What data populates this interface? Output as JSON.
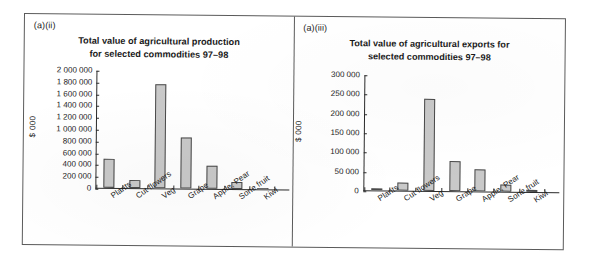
{
  "figure": {
    "panels": [
      {
        "label": "(a)(ii)",
        "title_line1": "Total value of agricultural production",
        "title_line2": "for selected commodities 97–98"
      },
      {
        "label": "(a)(iii)",
        "title_line1": "Total value of agricultural exports for",
        "title_line2": "selected commodities 97–98"
      }
    ]
  },
  "chart_data": [
    {
      "type": "bar",
      "title": "Total value of agricultural production for selected commodities 97–98",
      "panel_label": "(a)(ii)",
      "xlabel": "",
      "ylabel": "$ 000",
      "ylim": [
        0,
        2000000
      ],
      "ytick_step": 200000,
      "grid": false,
      "legend": "none",
      "bar_color": "#c9c9c9",
      "bar_edge_color": "#4a4a4a",
      "categories": [
        "Plants",
        "Cut flowers",
        "Veg",
        "Grape",
        "Apple, Pear",
        "Sone fruit",
        "Kiwi"
      ],
      "values": [
        500000,
        130000,
        1780000,
        880000,
        400000,
        120000,
        0
      ],
      "ytick_labels": [
        "0",
        "200 000",
        "400 000",
        "600 000",
        "800 000",
        "1 000 000",
        "1 200 000",
        "1 400 000",
        "1 600 000",
        "1 800 000",
        "2 000 000"
      ],
      "ytick_values": [
        0,
        200000,
        400000,
        600000,
        800000,
        1000000,
        1200000,
        1400000,
        1600000,
        1800000,
        2000000
      ]
    },
    {
      "type": "bar",
      "title": "Total value of agricultural exports for selected commodities 97–98",
      "panel_label": "(a)(iii)",
      "xlabel": "",
      "ylabel": "$ 000",
      "ylim": [
        0,
        300000
      ],
      "ytick_step": 50000,
      "grid": false,
      "legend": "none",
      "bar_color": "#c9c9c9",
      "bar_edge_color": "#4a4a4a",
      "categories": [
        "Plants",
        "Cut flowers",
        "Veg",
        "Grape",
        "Apple, Pear",
        "Sone fruit",
        "Kiwi"
      ],
      "values": [
        5000,
        21000,
        240000,
        78000,
        57000,
        17000,
        1500
      ],
      "ytick_labels": [
        "0",
        "50 000",
        "100 000",
        "150 000",
        "200 000",
        "250 000",
        "300 000"
      ],
      "ytick_values": [
        0,
        50000,
        100000,
        150000,
        200000,
        250000,
        300000
      ]
    }
  ]
}
